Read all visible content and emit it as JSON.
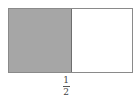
{
  "diagram": {
    "type": "fraction-area-model",
    "total_parts": 2,
    "shaded_parts": 1,
    "colors": {
      "shaded": "#a6a6a6",
      "unshaded": "#ffffff",
      "border": "#8a8a8a"
    },
    "label": {
      "numerator": "1",
      "denominator": "2"
    }
  }
}
